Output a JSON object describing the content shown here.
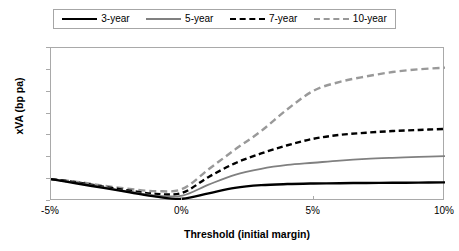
{
  "legend": {
    "entries": [
      {
        "label": "3-year",
        "style": "solid",
        "color": "#000000"
      },
      {
        "label": "5-year",
        "style": "solid",
        "color": "#808080"
      },
      {
        "label": "7-year",
        "style": "dashed",
        "color": "#000000"
      },
      {
        "label": "10-year",
        "style": "dashed",
        "color": "#999999"
      }
    ]
  },
  "axes": {
    "y_title": "xVA (bp pa)",
    "x_title": "Threshold (initial margin)",
    "y_ticks": [
      "-14",
      "-12",
      "-10",
      "-8",
      "-6",
      "-4",
      "-2",
      "0"
    ],
    "x_ticks": [
      "-5%",
      "0%",
      "5%",
      "10%"
    ]
  },
  "chart_data": {
    "type": "line",
    "title": "",
    "xlabel": "Threshold (initial margin)",
    "ylabel": "xVA (bp pa)",
    "xlim": [
      -5,
      10
    ],
    "ylim": [
      -14,
      0
    ],
    "y_axis_inverted": true,
    "grid": false,
    "legend_position": "top",
    "x": [
      -5,
      -4,
      -3,
      -2,
      -1,
      0,
      1,
      2,
      3,
      4,
      5,
      6,
      7,
      8,
      9,
      10
    ],
    "series": [
      {
        "name": "3-year",
        "style": "solid",
        "color": "#000000",
        "values": [
          -2.0,
          -1.6,
          -1.2,
          -0.8,
          -0.4,
          -0.2,
          -0.7,
          -1.2,
          -1.45,
          -1.55,
          -1.6,
          -1.63,
          -1.65,
          -1.67,
          -1.68,
          -1.7
        ]
      },
      {
        "name": "5-year",
        "style": "solid",
        "color": "#808080",
        "values": [
          -2.0,
          -1.65,
          -1.25,
          -0.85,
          -0.5,
          -0.5,
          -1.5,
          -2.4,
          -2.95,
          -3.3,
          -3.5,
          -3.7,
          -3.85,
          -3.95,
          -4.03,
          -4.1
        ]
      },
      {
        "name": "7-year",
        "style": "dashed",
        "color": "#000000",
        "values": [
          -2.0,
          -1.7,
          -1.3,
          -0.95,
          -0.65,
          -0.75,
          -2.2,
          -3.45,
          -4.35,
          -5.1,
          -5.7,
          -6.05,
          -6.25,
          -6.4,
          -6.5,
          -6.6
        ]
      },
      {
        "name": "10-year",
        "style": "dashed",
        "color": "#999999",
        "values": [
          -2.0,
          -1.75,
          -1.4,
          -1.1,
          -0.9,
          -1.1,
          -2.9,
          -4.7,
          -6.4,
          -8.4,
          -10.1,
          -10.9,
          -11.4,
          -11.8,
          -12.05,
          -12.2
        ]
      }
    ]
  }
}
